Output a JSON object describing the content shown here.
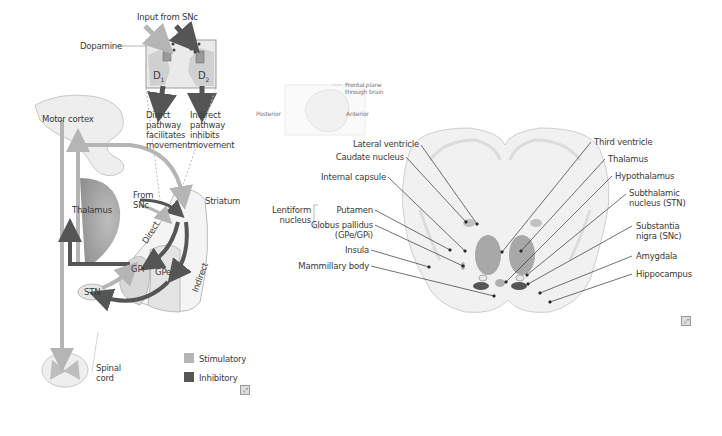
{
  "left_panel": {
    "input_title": "Input from SNc",
    "dopamine": "Dopamine",
    "d1": "D",
    "d1_sub": "1",
    "d2": "D",
    "d2_sub": "2",
    "direct_caption": [
      "Direct",
      "pathway",
      "facilitates",
      "movement"
    ],
    "indirect_caption": [
      "Indirect",
      "pathway",
      "inhibits",
      "movement"
    ],
    "motor_cortex": "Motor cortex",
    "thalamus": "Thalamus",
    "from_snc": [
      "From",
      "SNc"
    ],
    "striatum": "Striatum",
    "direct": "Direct",
    "indirect": "Indirect",
    "gpi": "GPi",
    "gpe": "GPe",
    "stn": "STN",
    "spinal_cord": [
      "Spinal",
      "cord"
    ],
    "legend": [
      {
        "label": "Stimulatory",
        "color": "#b5b5b5"
      },
      {
        "label": "Inhibitory",
        "color": "#555555"
      }
    ]
  },
  "right_panel": {
    "inset": {
      "frontal_plane": [
        "Frontal plane",
        "through brain"
      ],
      "posterior": "Posterior",
      "anterior": "Anterior"
    },
    "left_labels": {
      "lateral_ventricle": "Lateral ventricle",
      "caudate_nucleus": "Caudate nucleus",
      "internal_capsule": "Internal capsule",
      "lentiform_nucleus": [
        "Lentiform",
        "nucleus"
      ],
      "putamen": "Putamen",
      "globus_pallidus": [
        "Globus pallidus",
        "(GPe/GPi)"
      ],
      "insula": "Insula",
      "mammillary_body": "Mammillary body"
    },
    "right_labels": {
      "third_ventricle": "Third ventricle",
      "thalamus": "Thalamus",
      "hypothalamus": "Hypothalamus",
      "subthalamic_nucleus": [
        "Subthalamic",
        "nucleus (STN)"
      ],
      "substantia_nigra": [
        "Substantia",
        "nigra (SNc)"
      ],
      "amygdala": "Amygdala",
      "hippocampus": "Hippocampus"
    }
  },
  "colors": {
    "stimulatory": "#b5b5b5",
    "inhibitory": "#555555",
    "tissue": "#eeeeee",
    "tissue_outline": "#c8c8c8",
    "label_text": "#3a3a3a"
  }
}
